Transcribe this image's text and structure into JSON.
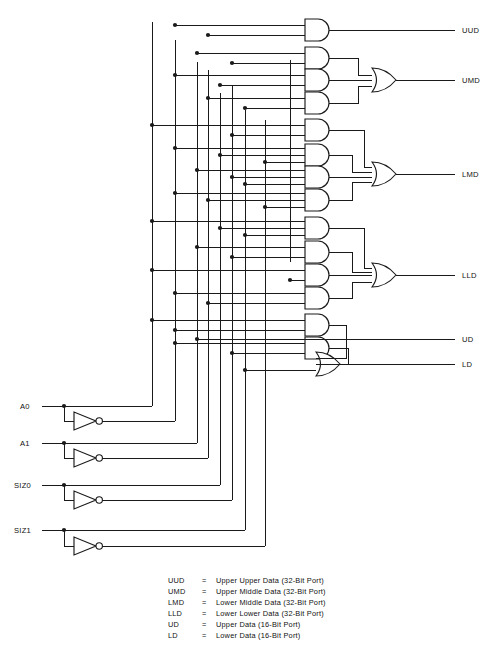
{
  "diagram": {
    "background_color": "#ffffff",
    "line_color": "#1a1a1a",
    "inputs": [
      {
        "id": "a0",
        "label": "A0",
        "y": 406,
        "has_inverter": true
      },
      {
        "id": "a1",
        "label": "A1",
        "y": 443,
        "has_inverter": true
      },
      {
        "id": "siz0",
        "label": "SIZ0",
        "y": 485,
        "has_inverter": true
      },
      {
        "id": "siz1",
        "label": "SIZ1",
        "y": 530,
        "has_inverter": true
      }
    ],
    "outputs": [
      {
        "id": "uud",
        "label": "UUD",
        "y": 30,
        "source": "and"
      },
      {
        "id": "umd",
        "label": "UMD",
        "y": 80,
        "source": "or"
      },
      {
        "id": "lmd",
        "label": "LMD",
        "y": 174,
        "source": "or"
      },
      {
        "id": "lld",
        "label": "LLD",
        "y": 275,
        "source": "or"
      },
      {
        "id": "ud",
        "label": "UD",
        "y": 339,
        "source": "direct"
      },
      {
        "id": "ld",
        "label": "LD",
        "y": 364,
        "source": "or"
      }
    ],
    "and_gates": [
      {
        "id": "and-1",
        "y": 30,
        "inputs": 2,
        "group": "uud"
      },
      {
        "id": "and-2",
        "y": 58,
        "inputs": 2,
        "group": "umd"
      },
      {
        "id": "and-3",
        "y": 80,
        "inputs": 2,
        "group": "umd"
      },
      {
        "id": "and-4",
        "y": 103,
        "inputs": 2,
        "group": "umd"
      },
      {
        "id": "and-5",
        "y": 130,
        "inputs": 2,
        "group": "lmd"
      },
      {
        "id": "and-6",
        "y": 155,
        "inputs": 3,
        "group": "lmd"
      },
      {
        "id": "and-7",
        "y": 177,
        "inputs": 3,
        "group": "lmd"
      },
      {
        "id": "and-8",
        "y": 200,
        "inputs": 3,
        "group": "lmd"
      },
      {
        "id": "and-9",
        "y": 228,
        "inputs": 3,
        "group": "lld"
      },
      {
        "id": "and-10",
        "y": 252,
        "inputs": 2,
        "group": "lld"
      },
      {
        "id": "and-11",
        "y": 275,
        "inputs": 2,
        "group": "lld"
      },
      {
        "id": "and-12",
        "y": 298,
        "inputs": 2,
        "group": "lld"
      },
      {
        "id": "and-13",
        "y": 325,
        "inputs": 2,
        "group": "ld"
      },
      {
        "id": "and-14",
        "y": 348,
        "inputs": 2,
        "group": "ld"
      }
    ],
    "or_gates": [
      {
        "id": "or-umd",
        "y": 80,
        "inputs": 3,
        "output": "UMD"
      },
      {
        "id": "or-lmd",
        "y": 174,
        "inputs": 4,
        "output": "LMD"
      },
      {
        "id": "or-lld",
        "y": 275,
        "inputs": 4,
        "output": "LLD"
      },
      {
        "id": "or-ld",
        "y": 364,
        "inputs": 3,
        "output": "LD"
      }
    ],
    "legend": {
      "separator": "=",
      "rows": [
        {
          "key": "UUD",
          "desc": "Upper Upper Data (32-Bit Port)"
        },
        {
          "key": "UMD",
          "desc": "Upper Middle Data (32-Bit Port)"
        },
        {
          "key": "LMD",
          "desc": "Lower Middle Data (32-Bit Port)"
        },
        {
          "key": "LLD",
          "desc": "Lower Lower Data (32-Bit Port)"
        },
        {
          "key": "UD",
          "desc": "Upper Data (16-Bit Port)"
        },
        {
          "key": "LD",
          "desc": "Lower Data (16-Bit Port)"
        }
      ]
    }
  }
}
